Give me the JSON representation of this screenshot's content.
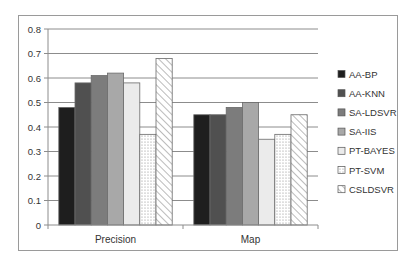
{
  "chart_data": {
    "type": "bar",
    "title": "",
    "xlabel": "",
    "ylabel": "",
    "categories": [
      "Precision",
      "Map"
    ],
    "ylim": [
      0,
      0.8
    ],
    "yticks": [
      0,
      0.1,
      0.2,
      0.3,
      0.4,
      0.5,
      0.6,
      0.7,
      0.8
    ],
    "ytick_labels": [
      "0",
      "0.1",
      "0.2",
      "0.3",
      "0.4",
      "0.5",
      "0.6",
      "0.7",
      "0.8"
    ],
    "grid": true,
    "legend_position": "right",
    "series": [
      {
        "name": "AA-BP",
        "values": [
          0.48,
          0.45
        ],
        "color": "#1e1e1e",
        "pattern": "solid"
      },
      {
        "name": "AA-KNN",
        "values": [
          0.58,
          0.45
        ],
        "color": "#505050",
        "pattern": "solid"
      },
      {
        "name": "SA-LDSVR",
        "values": [
          0.61,
          0.48
        ],
        "color": "#7c7c7c",
        "pattern": "solid"
      },
      {
        "name": "SA-IIS",
        "values": [
          0.62,
          0.5
        ],
        "color": "#a8a8a8",
        "pattern": "solid"
      },
      {
        "name": "PT-BAYES",
        "values": [
          0.58,
          0.35
        ],
        "color": "#ebebeb",
        "pattern": "solid"
      },
      {
        "name": "PT-SVM",
        "values": [
          0.37,
          0.37
        ],
        "color": "#ffffff",
        "pattern": "dots"
      },
      {
        "name": "CSLDSVR",
        "values": [
          0.68,
          0.45
        ],
        "color": "#ffffff",
        "pattern": "diagonal"
      }
    ]
  }
}
